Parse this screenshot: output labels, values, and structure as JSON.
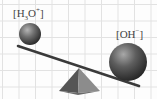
{
  "diagram": {
    "left_item": {
      "label_open": "[H",
      "label_sub": "3",
      "label_mid": "O",
      "label_sup": "+",
      "label_close": "]",
      "position": "raised",
      "relative_size": "small"
    },
    "right_item": {
      "label_open": "[OH",
      "label_sup": "−",
      "label_close": "]",
      "position": "lowered",
      "relative_size": "large"
    },
    "fulcrum": "pyramid",
    "background": "grid",
    "colors": {
      "grid": "#e2e2e2",
      "ball_light": "#9a9a9a",
      "ball_dark": "#2e2e2e",
      "beam": "#3a3a3a",
      "fulcrum_light": "#8a8a8a",
      "fulcrum_dark": "#4a4a4a",
      "label": "#444444"
    }
  }
}
